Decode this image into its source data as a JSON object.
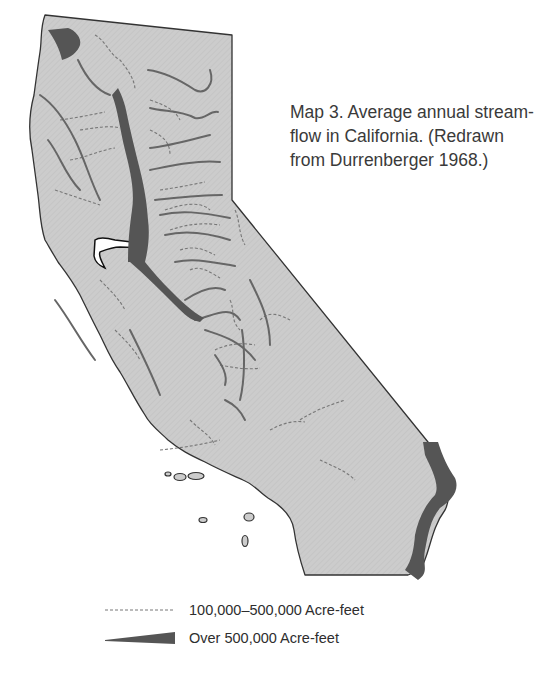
{
  "caption": {
    "lines": [
      "Map 3. Average annual stream-",
      "flow in California. (Redrawn",
      "from Durrenberger 1968.)"
    ]
  },
  "legend": {
    "items": [
      {
        "symbol": "dashed-line",
        "label": "100,000–500,000 Acre-feet"
      },
      {
        "symbol": "tapered-wedge",
        "label": "Over 500,000 Acre-feet"
      }
    ]
  },
  "colors": {
    "land_fill": "#cccccc",
    "land_hatch": "#bdbdbd",
    "border": "#333333",
    "major_river": "#555555",
    "minor_river": "#777777",
    "text": "#333333"
  }
}
